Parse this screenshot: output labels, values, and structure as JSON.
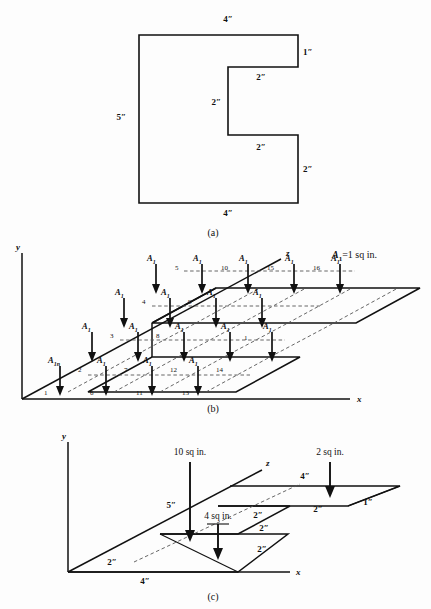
{
  "figure": {
    "panels": [
      {
        "id": "a",
        "label": "(a)"
      },
      {
        "id": "b",
        "label": "(b)"
      },
      {
        "id": "c",
        "label": "(c)"
      }
    ]
  },
  "panel_a": {
    "label": "(a)",
    "shape_name": "e-shaped-cross-section",
    "dimensions": [
      {
        "name": "top-width",
        "text": "4″",
        "x": 228,
        "y": 22
      },
      {
        "name": "right-top-height",
        "text": "1″",
        "x": 299,
        "y": 55
      },
      {
        "name": "upper-notch-width",
        "text": "2″",
        "x": 260,
        "y": 77
      },
      {
        "name": "notch-height",
        "text": "2″",
        "x": 236,
        "y": 112
      },
      {
        "name": "lower-notch-width",
        "text": "2″",
        "x": 260,
        "y": 147
      },
      {
        "name": "right-bot-height",
        "text": "2″",
        "x": 299,
        "y": 181
      },
      {
        "name": "left-height",
        "text": "5″",
        "x": 118,
        "y": 115
      },
      {
        "name": "bottom-width",
        "text": "4″",
        "x": 228,
        "y": 213
      }
    ]
  },
  "panel_b": {
    "label": "(b)",
    "legend": "A₁ = 1 sq in.",
    "legend_symbol": "A",
    "legend_sub": "1",
    "legend_rest": "=1 sq in.",
    "axes": [
      {
        "name": "y-axis",
        "text": "y"
      },
      {
        "name": "x-axis",
        "text": "x"
      },
      {
        "name": "z-axis",
        "text": "z"
      }
    ],
    "force_label": "A",
    "force_sub": "1",
    "first_force_label": "A",
    "first_force_sub": "1n",
    "element_numbers": [
      "1",
      "2",
      "3",
      "4",
      "5",
      "6",
      "7",
      "8",
      "9",
      "10",
      "11",
      "12",
      "13",
      "14",
      "15",
      "16"
    ],
    "element_count": 16
  },
  "panel_c": {
    "label": "(c)",
    "axes": [
      {
        "name": "y-axis",
        "text": "y"
      },
      {
        "name": "x-axis",
        "text": "x"
      },
      {
        "name": "z-axis",
        "text": "z"
      }
    ],
    "loads": [
      {
        "name": "load-10",
        "text": "10 sq in."
      },
      {
        "name": "load-4",
        "text": "4 sq in."
      },
      {
        "name": "load-2",
        "text": "2 sq in."
      }
    ],
    "dimensions": [
      {
        "name": "c-height-5",
        "text": "5″"
      },
      {
        "name": "c-top-4",
        "text": "4″"
      },
      {
        "name": "c-right-1",
        "text": "1″"
      },
      {
        "name": "c-upper-2a",
        "text": "2″"
      },
      {
        "name": "c-mid-2a",
        "text": "2″"
      },
      {
        "name": "c-mid-2b",
        "text": "2″"
      },
      {
        "name": "c-low-2",
        "text": "2″"
      },
      {
        "name": "c-base-2",
        "text": "2″"
      },
      {
        "name": "c-base-4",
        "text": "4″"
      }
    ]
  },
  "colors": {
    "ink": "#111111",
    "dashed": "#555555",
    "background": "#fdfdfd"
  }
}
